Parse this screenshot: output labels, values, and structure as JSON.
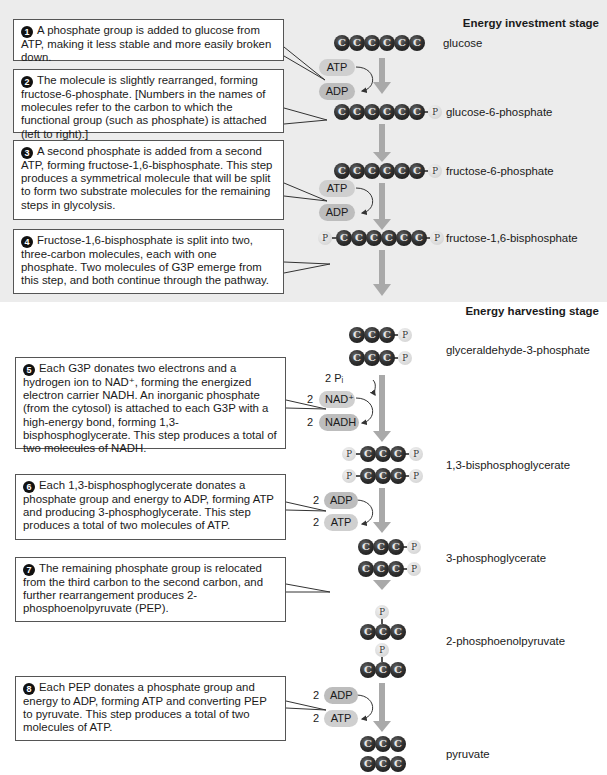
{
  "stages": {
    "investment": "Energy investment stage",
    "harvesting": "Energy harvesting stage"
  },
  "steps": [
    {
      "num": "1",
      "text": "A phosphate group is added to glucose from ATP, making it less stable and more easily broken down."
    },
    {
      "num": "2",
      "text": "The molecule is slightly rearranged, forming fructose-6-phosphate. [Numbers in the names of molecules refer to the carbon to which the functional group (such as phosphate) is attached (left to right).]"
    },
    {
      "num": "3",
      "text": "A second phosphate is added from a second ATP, forming fructose-1,6-bisphosphate. This step produces a symmetrical molecule that will be split to form two substrate molecules for the remaining steps in glycolysis."
    },
    {
      "num": "4",
      "text": "Fructose-1,6-bisphosphate is split into two, three-carbon molecules, each with one phosphate. Two molecules of G3P emerge from this step, and both continue through the pathway."
    },
    {
      "num": "5",
      "text": "Each G3P donates two electrons and a hydrogen ion to NAD⁺, forming the energized electron carrier NADH. An inorganic phosphate (from the cytosol) is attached to each G3P with a high-energy bond, forming 1,3-bisphosphoglycerate. This step produces a total of two molecules of NADH."
    },
    {
      "num": "6",
      "text": "Each 1,3-bisphosphoglycerate donates a phosphate group and energy to ADP, forming ATP and producing 3-phosphoglycerate. This step produces a total of two molecules of ATP."
    },
    {
      "num": "7",
      "text": "The remaining phosphate group is relocated from the third carbon to the second carbon, and further rearrangement produces 2-phosphoenolpyruvate (PEP)."
    },
    {
      "num": "8",
      "text": "Each PEP donates a phosphate group and energy to ADP, forming ATP and converting PEP to pyruvate. This step produces a total of two molecules of ATP."
    }
  ],
  "molecules": {
    "glucose": "glucose",
    "g6p": "glucose-6-phosphate",
    "f6p": "fructose-6-phosphate",
    "f16bp": "fructose-1,6-bisphosphate",
    "g3p": "glyceraldehyde-3-phosphate",
    "bpg": "1,3-bisphosphoglycerate",
    "pg3": "3-phosphoglycerate",
    "pep": "2-phosphoenolpyruvate",
    "pyruvate": "pyruvate"
  },
  "atoms": {
    "carbon": "C",
    "phosphate": "P"
  },
  "cofactors": {
    "atp": "ATP",
    "adp": "ADP",
    "nad": "NAD⁺",
    "nadh": "NADH",
    "pi": "2 Pᵢ",
    "two": "2"
  }
}
